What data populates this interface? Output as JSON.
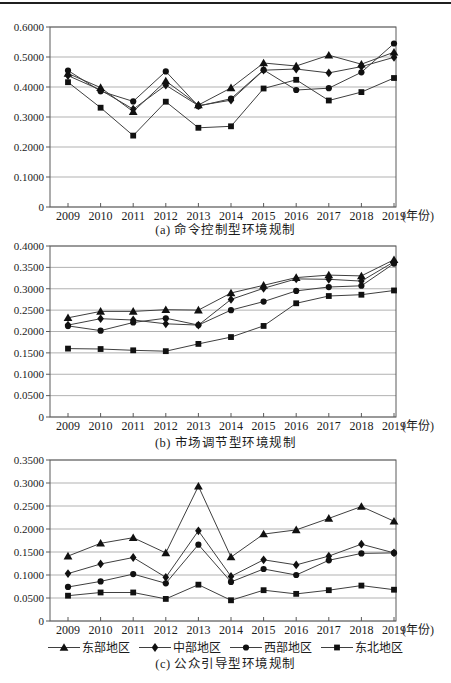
{
  "page": {
    "type": "scanned-figure",
    "background": "#ffffff",
    "rule_color": "#1f1f1f"
  },
  "colors": {
    "line": "#3f3f3f",
    "marker": "#111111",
    "grid": "#8f8f8f",
    "border": "#5a5a5a",
    "text": "#1b1b1b"
  },
  "x_axis": {
    "years": [
      "2009",
      "2010",
      "2011",
      "2012",
      "2013",
      "2014",
      "2015",
      "2016",
      "2017",
      "2018",
      "2019"
    ],
    "suffix": "(年份)"
  },
  "legend": {
    "items": [
      {
        "key": "east",
        "label": "东部地区",
        "marker": "triangle"
      },
      {
        "key": "central",
        "label": "中部地区",
        "marker": "diamond"
      },
      {
        "key": "west",
        "label": "西部地区",
        "marker": "circle"
      },
      {
        "key": "northeast",
        "label": "东北地区",
        "marker": "square"
      }
    ]
  },
  "chart_data": [
    {
      "type": "line",
      "title": "(a) 命令控制型环境规制",
      "x": [
        2009,
        2010,
        2011,
        2012,
        2013,
        2014,
        2015,
        2016,
        2017,
        2018,
        2019
      ],
      "xlabel": "年份",
      "ylim": [
        0,
        0.6
      ],
      "ytick_step": 0.1,
      "ytick_labels": [
        "0.6000",
        "0.5000",
        "0.4000",
        "0.3000",
        "0.2000",
        "0.1000",
        "0"
      ],
      "grid": true,
      "legend_position": "below-figure",
      "series": [
        {
          "key": "east",
          "name": "东部地区",
          "marker": "triangle",
          "values": [
            0.445,
            0.398,
            0.318,
            0.42,
            0.34,
            0.397,
            0.48,
            0.47,
            0.506,
            0.476,
            0.516
          ]
        },
        {
          "key": "central",
          "name": "中部地区",
          "marker": "diamond",
          "values": [
            0.438,
            0.39,
            0.326,
            0.406,
            0.338,
            0.356,
            0.456,
            0.46,
            0.447,
            0.468,
            0.499
          ]
        },
        {
          "key": "west",
          "name": "西部地区",
          "marker": "circle",
          "values": [
            0.455,
            0.386,
            0.352,
            0.452,
            0.336,
            0.361,
            0.457,
            0.39,
            0.396,
            0.449,
            0.545
          ]
        },
        {
          "key": "northeast",
          "name": "东北地区",
          "marker": "square",
          "values": [
            0.416,
            0.331,
            0.238,
            0.351,
            0.264,
            0.269,
            0.395,
            0.424,
            0.355,
            0.383,
            0.43
          ]
        }
      ]
    },
    {
      "type": "line",
      "title": "(b) 市场调节型环境规制",
      "x": [
        2009,
        2010,
        2011,
        2012,
        2013,
        2014,
        2015,
        2016,
        2017,
        2018,
        2019
      ],
      "xlabel": "年份",
      "ylim": [
        0,
        0.4
      ],
      "ytick_step": 0.05,
      "ytick_labels": [
        "0.4000",
        "0.3500",
        "0.3000",
        "0.2500",
        "0.2000",
        "0.1500",
        "0.1000",
        "0.0500",
        "0"
      ],
      "grid": true,
      "legend_position": "below-figure",
      "series": [
        {
          "key": "east",
          "name": "东部地区",
          "marker": "triangle",
          "values": [
            0.232,
            0.247,
            0.247,
            0.251,
            0.25,
            0.29,
            0.308,
            0.326,
            0.332,
            0.33,
            0.368
          ]
        },
        {
          "key": "central",
          "name": "中部地区",
          "marker": "diamond",
          "values": [
            0.215,
            0.23,
            0.227,
            0.218,
            0.215,
            0.275,
            0.301,
            0.323,
            0.322,
            0.318,
            0.363
          ]
        },
        {
          "key": "west",
          "name": "西部地区",
          "marker": "circle",
          "values": [
            0.213,
            0.202,
            0.221,
            0.231,
            0.215,
            0.25,
            0.27,
            0.295,
            0.304,
            0.307,
            0.359
          ]
        },
        {
          "key": "northeast",
          "name": "东北地区",
          "marker": "square",
          "values": [
            0.16,
            0.159,
            0.156,
            0.154,
            0.171,
            0.187,
            0.213,
            0.266,
            0.283,
            0.286,
            0.296
          ]
        }
      ]
    },
    {
      "type": "line",
      "title": "(c) 公众引导型环境规制",
      "x": [
        2009,
        2010,
        2011,
        2012,
        2013,
        2014,
        2015,
        2016,
        2017,
        2018,
        2019
      ],
      "xlabel": "年份",
      "ylim": [
        0,
        0.35
      ],
      "ytick_step": 0.05,
      "ytick_labels": [
        "0.3500",
        "0.3000",
        "0.2500",
        "0.2000",
        "0.1500",
        "0.1000",
        "0.0500",
        "0"
      ],
      "grid": true,
      "legend_position": "below-figure",
      "series": [
        {
          "key": "east",
          "name": "东部地区",
          "marker": "triangle",
          "values": [
            0.141,
            0.169,
            0.181,
            0.148,
            0.293,
            0.139,
            0.189,
            0.198,
            0.223,
            0.249,
            0.217
          ]
        },
        {
          "key": "central",
          "name": "中部地区",
          "marker": "diamond",
          "values": [
            0.103,
            0.124,
            0.138,
            0.095,
            0.196,
            0.097,
            0.133,
            0.122,
            0.141,
            0.167,
            0.148
          ]
        },
        {
          "key": "west",
          "name": "西部地区",
          "marker": "circle",
          "values": [
            0.074,
            0.086,
            0.102,
            0.082,
            0.166,
            0.085,
            0.113,
            0.1,
            0.132,
            0.147,
            0.148
          ]
        },
        {
          "key": "northeast",
          "name": "东北地区",
          "marker": "square",
          "values": [
            0.055,
            0.062,
            0.062,
            0.048,
            0.079,
            0.045,
            0.067,
            0.059,
            0.067,
            0.077,
            0.068
          ]
        }
      ]
    }
  ]
}
